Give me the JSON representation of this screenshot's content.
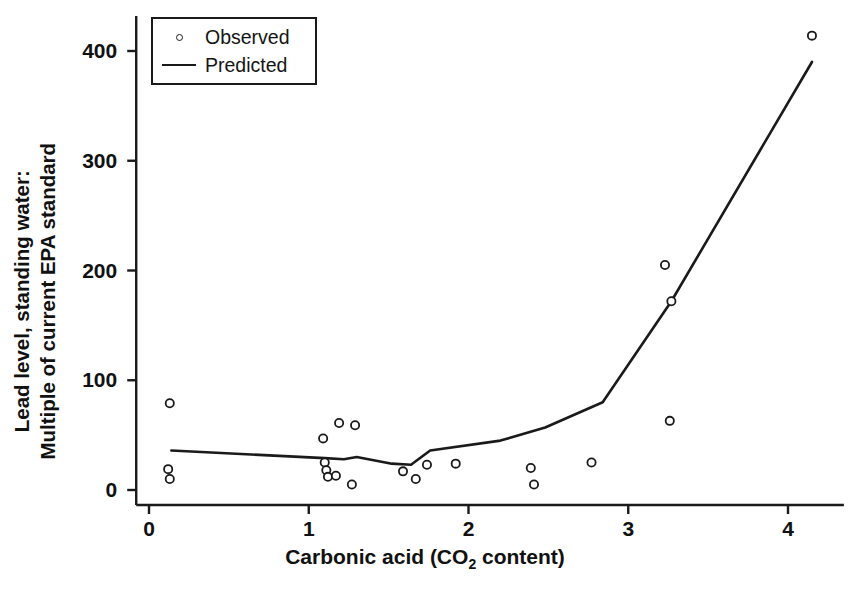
{
  "chart_data": {
    "type": "scatter",
    "title": "",
    "subtitle": "",
    "xlabel_prefix": "Carbonic acid (CO",
    "xlabel_sub": "2",
    "xlabel_suffix": " content)",
    "xlabel": "Carbonic acid (CO2 content)",
    "ylabel_line1": "Lead level, standing water:",
    "ylabel_line2": "Multiple of current EPA standard",
    "ylabel": "Lead level, standing water: Multiple of current EPA standard",
    "xlim": [
      -0.08,
      4.35
    ],
    "ylim": [
      -12,
      432
    ],
    "xticks": [
      0,
      1,
      2,
      3,
      4
    ],
    "xtick_labels": [
      "0",
      "1",
      "2",
      "3",
      "4"
    ],
    "yticks": [
      0,
      100,
      200,
      300,
      400
    ],
    "ytick_labels": [
      "0",
      "100",
      "200",
      "300",
      "400"
    ],
    "grid": false,
    "legend_position": "upper-left-inside",
    "series": [
      {
        "name": "Observed",
        "type": "scatter",
        "marker": "open-circle",
        "color": "#1a1a1a",
        "points": [
          {
            "x": 0.13,
            "y": 79
          },
          {
            "x": 0.12,
            "y": 19
          },
          {
            "x": 0.13,
            "y": 10
          },
          {
            "x": 1.09,
            "y": 47
          },
          {
            "x": 1.19,
            "y": 61
          },
          {
            "x": 1.29,
            "y": 59
          },
          {
            "x": 1.1,
            "y": 25
          },
          {
            "x": 1.11,
            "y": 18
          },
          {
            "x": 1.12,
            "y": 12
          },
          {
            "x": 1.17,
            "y": 13
          },
          {
            "x": 1.27,
            "y": 5
          },
          {
            "x": 1.59,
            "y": 17
          },
          {
            "x": 1.67,
            "y": 10
          },
          {
            "x": 1.74,
            "y": 23
          },
          {
            "x": 1.92,
            "y": 24
          },
          {
            "x": 2.39,
            "y": 20
          },
          {
            "x": 2.41,
            "y": 5
          },
          {
            "x": 2.77,
            "y": 25
          },
          {
            "x": 3.23,
            "y": 205
          },
          {
            "x": 3.27,
            "y": 172
          },
          {
            "x": 3.26,
            "y": 63
          },
          {
            "x": 4.15,
            "y": 414
          }
        ]
      },
      {
        "name": "Predicted",
        "type": "line",
        "color": "#1a1a1a",
        "points": [
          {
            "x": 0.14,
            "y": 36
          },
          {
            "x": 1.1,
            "y": 29
          },
          {
            "x": 1.22,
            "y": 28
          },
          {
            "x": 1.3,
            "y": 30
          },
          {
            "x": 1.52,
            "y": 24
          },
          {
            "x": 1.64,
            "y": 23
          },
          {
            "x": 1.76,
            "y": 36
          },
          {
            "x": 2.2,
            "y": 45
          },
          {
            "x": 2.48,
            "y": 57
          },
          {
            "x": 2.84,
            "y": 80
          },
          {
            "x": 3.27,
            "y": 172
          },
          {
            "x": 4.15,
            "y": 390
          }
        ]
      }
    ],
    "legend": [
      {
        "label": "Observed",
        "marker": "open-circle"
      },
      {
        "label": "Predicted",
        "marker": "line"
      }
    ]
  }
}
